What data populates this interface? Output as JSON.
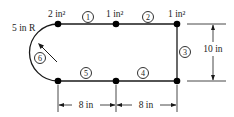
{
  "diagram": {
    "stringer_areas": {
      "top_left": "2 in²",
      "top_middle": "1 in²",
      "top_right": "1 in²"
    },
    "radius_label": "5 in R",
    "panels": [
      {
        "id": "1",
        "label": "1"
      },
      {
        "id": "2",
        "label": "2"
      },
      {
        "id": "3",
        "label": "3"
      },
      {
        "id": "4",
        "label": "4"
      },
      {
        "id": "5",
        "label": "5"
      },
      {
        "id": "6",
        "label": "6"
      }
    ],
    "dimensions": {
      "height": "10 in",
      "bottom_left_span": "8 in",
      "bottom_right_span": "8 in"
    },
    "colors": {
      "line": "#1a1a1a",
      "node": "#000000",
      "background": "#ffffff"
    }
  }
}
